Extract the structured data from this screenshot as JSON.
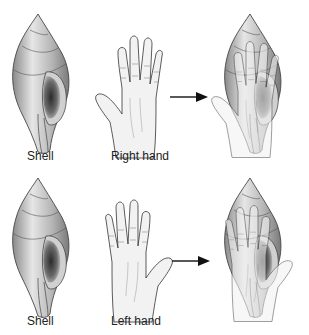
{
  "figure": {
    "rows": [
      {
        "shell_label": "Shell",
        "hand_label": "Right hand",
        "result": "shell-and-right-hand-superimposed"
      },
      {
        "shell_label": "Shell",
        "hand_label": "Left hand",
        "result": "shell-and-left-hand-superimposed"
      }
    ]
  },
  "colors": {
    "shell_light": "#e8e8e8",
    "shell_mid": "#a8a8a8",
    "shell_dark": "#555555",
    "hand_fill": "#f2f2f2",
    "outline": "#333333"
  }
}
